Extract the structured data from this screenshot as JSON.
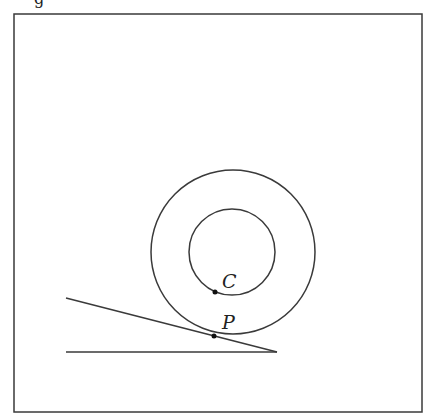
{
  "figure": {
    "caption_fragment": "g",
    "frame": {
      "x1": 14,
      "y1": 14,
      "x2": 422,
      "y2": 412
    },
    "stroke_color": "#3a3a3a",
    "outer_circle": {
      "cx": 233,
      "cy": 252,
      "r": 82
    },
    "inner_circle": {
      "cx": 232,
      "cy": 252,
      "r": 43
    },
    "incline_line": {
      "x1": 66,
      "y1": 298,
      "x2": 277,
      "y2": 352
    },
    "ground_line": {
      "x1": 66,
      "y1": 352,
      "x2": 277,
      "y2": 352
    },
    "points": [
      {
        "name": "C",
        "x": 215,
        "y": 292,
        "label_x": 222,
        "label_y": 288
      },
      {
        "name": "P",
        "x": 214,
        "y": 336,
        "label_x": 222,
        "label_y": 329
      }
    ]
  }
}
